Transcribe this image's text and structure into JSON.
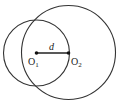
{
  "diagram": {
    "type": "two-intersecting-circles",
    "circles": [
      {
        "name": "O1",
        "cx": 36.5,
        "cy": 53,
        "r": 33
      },
      {
        "name": "O2",
        "cx": 68.5,
        "cy": 52.5,
        "r": 47
      }
    ],
    "segment": {
      "from": "O1",
      "to": "O2",
      "label": "d"
    },
    "labels": {
      "d": "d",
      "o1_main": "O",
      "o1_sub": "1",
      "o2_main": "O",
      "o2_sub": "2"
    },
    "colors": {
      "stroke": "#333333",
      "background": "#ffffff"
    }
  }
}
